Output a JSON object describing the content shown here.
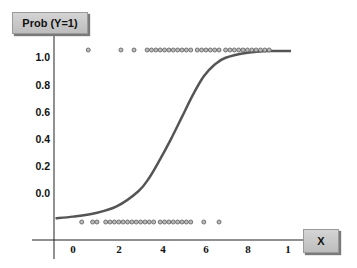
{
  "chart_data": {
    "type": "scatter",
    "title": "",
    "xlabel": "X",
    "ylabel": "Prob (Y=1)",
    "x_tick_labels": [
      "0",
      "2",
      "4",
      "6",
      "8",
      "1"
    ],
    "y_tick_labels": [
      "1.0",
      "0.8",
      "0.6",
      "0.4",
      "0.2",
      "0.0"
    ],
    "grid": false,
    "legend": null,
    "series": [
      {
        "name": "Observed Y=1",
        "type": "scatter",
        "y": 1.0,
        "x": [
          0.7,
          2.2,
          2.8,
          3.4,
          3.6,
          3.8,
          4.0,
          4.2,
          4.4,
          4.6,
          4.8,
          5.0,
          5.2,
          5.4,
          5.7,
          5.9,
          6.1,
          6.3,
          6.5,
          6.7,
          7.0,
          7.2,
          7.4,
          7.6,
          7.8,
          8.0,
          8.2,
          8.4,
          8.6,
          8.8,
          9.0
        ]
      },
      {
        "name": "Observed Y=0",
        "type": "scatter",
        "y": 0.0,
        "x": [
          0.4,
          0.9,
          1.1,
          1.5,
          1.7,
          1.9,
          2.1,
          2.3,
          2.5,
          2.7,
          2.9,
          3.1,
          3.3,
          3.5,
          3.7,
          4.0,
          4.2,
          4.4,
          4.6,
          4.8,
          5.0,
          5.2,
          5.4,
          6.0,
          6.7
        ]
      },
      {
        "name": "Logistic fit",
        "type": "line",
        "x": [
          -0.8,
          0,
          1,
          2,
          3,
          3.5,
          4,
          4.5,
          5,
          5.5,
          6,
          6.5,
          7,
          8,
          9,
          10
        ],
        "y": [
          0.01,
          0.02,
          0.04,
          0.08,
          0.17,
          0.25,
          0.36,
          0.48,
          0.61,
          0.74,
          0.85,
          0.92,
          0.96,
          0.99,
          1.0,
          1.0
        ]
      }
    ]
  },
  "labels": {
    "y_axis": "Prob (Y=1)",
    "x_axis": "X"
  },
  "colors": {
    "curve": "#555555",
    "points": "#666666",
    "axis": "#222222",
    "label_box": "#c8c8c8"
  }
}
